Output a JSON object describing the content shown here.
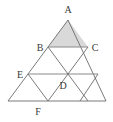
{
  "figure": {
    "type": "geometry-diagram",
    "colors": {
      "stroke": "#6b6b6b",
      "label": "#3a3a3a",
      "shade_fill": "#d9d9d9",
      "background": "#ffffff",
      "accent_line": "#8a8a8a"
    },
    "stroke_width": 0.9,
    "canvas": {
      "width": 113,
      "height": 122
    },
    "outer_triangle": {
      "apex": {
        "x": 68,
        "y": 20
      },
      "bottom_left": {
        "x": 8,
        "y": 101
      },
      "bottom_right": {
        "x": 106,
        "y": 101
      },
      "rows": 4
    },
    "labeled_points": [
      {
        "id": "A",
        "label": "A",
        "px": 68,
        "py": 20,
        "label_x": 68,
        "label_y": 12,
        "anchor": "middle"
      },
      {
        "id": "B",
        "label": "B",
        "px": 48,
        "py": 47,
        "label_x": 41,
        "label_y": 50,
        "anchor": "middle"
      },
      {
        "id": "C",
        "label": "C",
        "px": 88,
        "py": 47,
        "label_x": 94,
        "label_y": 50,
        "anchor": "middle"
      },
      {
        "id": "E",
        "label": "E",
        "px": 28,
        "py": 74,
        "label_x": 20,
        "label_y": 77,
        "anchor": "middle"
      },
      {
        "id": "D",
        "label": "D",
        "px": 68,
        "py": 74,
        "label_x": 63,
        "label_y": 88,
        "anchor": "middle"
      },
      {
        "id": "F",
        "label": "F",
        "px": 38,
        "py": 101,
        "label_x": 38,
        "label_y": 113,
        "anchor": "middle"
      }
    ],
    "shaded_region": {
      "name": "triangle-ABC",
      "points": "68,20 48,47 88,47"
    },
    "edges": {
      "outline": "68,20 106,101 8,101",
      "horizontals": [
        {
          "name": "row-1-BC",
          "x1": 48,
          "y1": 47,
          "x2": 88,
          "y2": 47,
          "emphasis": true
        },
        {
          "name": "row-2-ED",
          "x1": 28,
          "y1": 74,
          "x2": 98,
          "y2": 74,
          "emphasis": true
        }
      ],
      "left_diagonals": [
        {
          "name": "left-diag-1",
          "x1": 48,
          "y1": 47,
          "x2": 68,
          "y2": 74
        },
        {
          "name": "left-diag-2",
          "x1": 28,
          "y1": 74,
          "x2": 38,
          "y2": 101
        },
        {
          "name": "left-diag-3",
          "x1": 68,
          "y1": 74,
          "x2": 82,
          "y2": 101
        }
      ],
      "right_diagonals": [
        {
          "name": "right-diag-1",
          "x1": 88,
          "y1": 47,
          "x2": 68,
          "y2": 74
        },
        {
          "name": "right-diag-2",
          "x1": 68,
          "y1": 74,
          "x2": 38,
          "y2": 101
        },
        {
          "name": "right-diag-3",
          "x1": 98,
          "y1": 74,
          "x2": 82,
          "y2": 101
        }
      ]
    }
  }
}
